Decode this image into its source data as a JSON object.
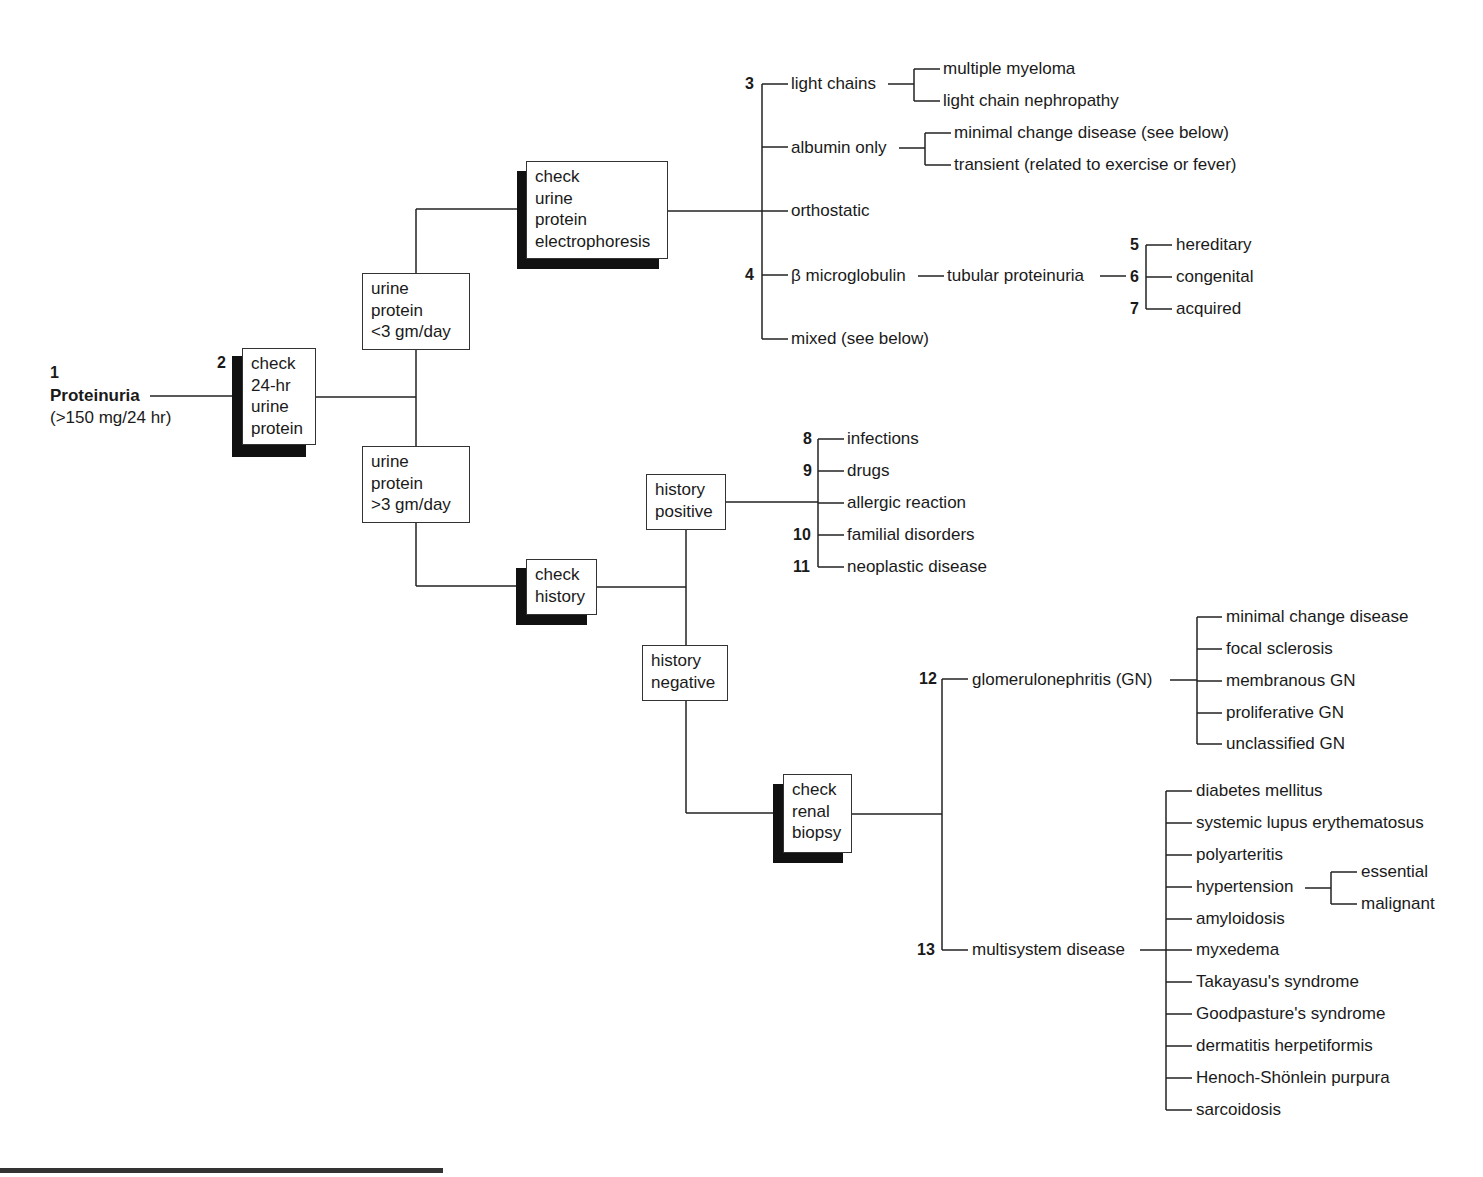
{
  "root": {
    "number": "1",
    "label": "Proteinuria",
    "sub": "(>150 mg/24 hr)"
  },
  "boxes": {
    "check24": {
      "number": "2",
      "text": "check\n24-hr\nurine\nprotein"
    },
    "lt3": {
      "text": "urine\nprotein\n<3 gm/day"
    },
    "gt3": {
      "text": "urine\nprotein\n>3 gm/day"
    },
    "electro": {
      "text": "check\nurine\nprotein\nelectrophoresis"
    },
    "history": {
      "text": "check\nhistory"
    },
    "histpos": {
      "text": "history\npositive"
    },
    "histneg": {
      "text": "history\nnegative"
    },
    "biopsy": {
      "text": "check\nrenal\nbiopsy"
    }
  },
  "electrophoresis_results": [
    {
      "number": "3",
      "label": "light chains",
      "children": [
        "multiple myeloma",
        "light chain nephropathy"
      ]
    },
    {
      "number": "",
      "label": "albumin only",
      "children": [
        "minimal change disease (see below)",
        "transient (related to exercise or fever)"
      ]
    },
    {
      "number": "",
      "label": "orthostatic"
    },
    {
      "number": "4",
      "label": "β microglobulin",
      "next": "tubular proteinuria",
      "next_number": "6",
      "children": [
        {
          "number": "5",
          "label": "hereditary"
        },
        {
          "number": "6",
          "label": "congenital"
        },
        {
          "number": "7",
          "label": "acquired"
        }
      ]
    },
    {
      "number": "",
      "label": "mixed (see below)"
    }
  ],
  "history_positive": [
    {
      "number": "8",
      "label": "infections"
    },
    {
      "number": "9",
      "label": "drugs"
    },
    {
      "number": "",
      "label": "allergic reaction"
    },
    {
      "number": "10",
      "label": "familial disorders"
    },
    {
      "number": "11",
      "label": "neoplastic disease"
    }
  ],
  "biopsy_results": {
    "gn": {
      "number": "12",
      "label": "glomerulonephritis (GN)",
      "children": [
        "minimal change disease",
        "focal sclerosis",
        "membranous GN",
        "proliferative GN",
        "unclassified GN"
      ]
    },
    "multi": {
      "number": "13",
      "label": "multisystem disease",
      "children": [
        "diabetes mellitus",
        "systemic lupus erythematosus",
        "polyarteritis",
        "hypertension",
        "amyloidosis",
        "myxedema",
        "Takayasu's syndrome",
        "Goodpasture's syndrome",
        "dermatitis herpetiformis",
        "Henoch-Shönlein purpura",
        "sarcoidosis"
      ],
      "hypertension_children": [
        "essential",
        "malignant"
      ]
    }
  }
}
